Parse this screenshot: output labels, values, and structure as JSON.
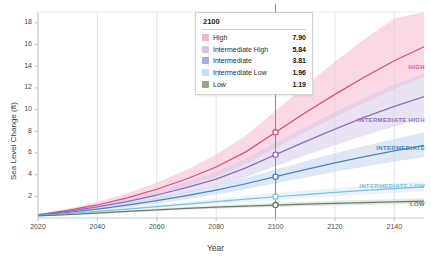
{
  "chart_data": {
    "type": "line",
    "title": "",
    "xlabel": "Year",
    "ylabel": "Sea Level Change (ft)",
    "xlim": [
      2020,
      2150
    ],
    "ylim": [
      0,
      19
    ],
    "xticks": [
      2020,
      2040,
      2060,
      2080,
      2100,
      2120,
      2140
    ],
    "yticks": [
      2,
      4,
      6,
      8,
      10,
      12,
      14,
      16,
      18
    ],
    "grid": "vertical-only",
    "legend_position": "inside-top-center",
    "hover_year": 2100,
    "x": [
      2020,
      2030,
      2040,
      2050,
      2060,
      2070,
      2080,
      2090,
      2100,
      2110,
      2120,
      2130,
      2140,
      2150
    ],
    "series": [
      {
        "name": "High",
        "label": "HIGH",
        "color": "#d4507f",
        "band_color": "#f7b8d0",
        "value_2100": "7.90",
        "values": [
          0.3,
          0.7,
          1.2,
          1.85,
          2.65,
          3.6,
          4.7,
          6.1,
          7.9,
          9.7,
          11.4,
          13.0,
          14.5,
          15.8
        ],
        "band_low": [
          0.25,
          0.58,
          0.98,
          1.5,
          2.15,
          2.9,
          3.8,
          4.95,
          6.45,
          7.9,
          9.3,
          10.6,
          11.9,
          13.0
        ],
        "band_high": [
          0.36,
          0.85,
          1.48,
          2.28,
          3.25,
          4.45,
          5.85,
          7.6,
          9.9,
          12.2,
          14.4,
          16.5,
          18.4,
          19.0
        ]
      },
      {
        "name": "Intermediate High",
        "label": "INTERMEDIATE HIGH",
        "color": "#8b6fb5",
        "band_color": "#d7cae8",
        "value_2100": "5.84",
        "values": [
          0.28,
          0.62,
          1.02,
          1.52,
          2.12,
          2.8,
          3.58,
          4.62,
          5.84,
          7.05,
          8.2,
          9.3,
          10.3,
          11.2
        ],
        "band_low": [
          0.23,
          0.52,
          0.85,
          1.26,
          1.74,
          2.3,
          2.94,
          3.78,
          4.78,
          5.78,
          6.72,
          7.62,
          8.44,
          9.18
        ],
        "band_high": [
          0.33,
          0.73,
          1.21,
          1.8,
          2.52,
          3.34,
          4.26,
          5.5,
          6.96,
          8.4,
          9.78,
          11.08,
          12.28,
          13.35
        ]
      },
      {
        "name": "Intermediate",
        "label": "INTERMEDIATE",
        "color": "#4f7fc0",
        "band_color": "#c3d4ec",
        "value_2100": "3.81",
        "values": [
          0.25,
          0.52,
          0.82,
          1.18,
          1.6,
          2.06,
          2.58,
          3.16,
          3.81,
          4.46,
          5.08,
          5.66,
          6.2,
          6.7
        ],
        "band_low": [
          0.21,
          0.44,
          0.69,
          0.99,
          1.34,
          1.73,
          2.16,
          2.65,
          3.2,
          3.74,
          4.26,
          4.75,
          5.2,
          5.62
        ],
        "band_high": [
          0.3,
          0.61,
          0.96,
          1.38,
          1.88,
          2.42,
          3.03,
          3.71,
          4.48,
          5.24,
          5.97,
          6.65,
          7.29,
          7.88
        ]
      },
      {
        "name": "Intermediate Low",
        "label": "INTERMEDIATE LOW",
        "color": "#7fbfe0",
        "band_color": "#d5eaf5",
        "value_2100": "1.96",
        "values": [
          0.22,
          0.4,
          0.6,
          0.82,
          1.05,
          1.28,
          1.52,
          1.74,
          1.96,
          2.16,
          2.36,
          2.54,
          2.72,
          2.88
        ],
        "band_low": [
          0.19,
          0.34,
          0.51,
          0.69,
          0.89,
          1.09,
          1.29,
          1.48,
          1.67,
          1.84,
          2.01,
          2.16,
          2.31,
          2.45
        ],
        "band_high": [
          0.26,
          0.47,
          0.7,
          0.96,
          1.23,
          1.5,
          1.78,
          2.04,
          2.3,
          2.53,
          2.77,
          2.98,
          3.19,
          3.38
        ]
      },
      {
        "name": "Low",
        "label": "LOW",
        "color": "#6e7a6b",
        "band_color": "#cdd7c9",
        "value_2100": "1.19",
        "values": [
          0.2,
          0.32,
          0.46,
          0.6,
          0.74,
          0.88,
          1.01,
          1.1,
          1.19,
          1.27,
          1.35,
          1.42,
          1.49,
          1.55
        ],
        "band_low": [
          0.17,
          0.27,
          0.39,
          0.51,
          0.63,
          0.75,
          0.86,
          0.94,
          1.01,
          1.08,
          1.15,
          1.21,
          1.27,
          1.32
        ],
        "band_high": [
          0.24,
          0.38,
          0.54,
          0.7,
          0.87,
          1.03,
          1.18,
          1.29,
          1.4,
          1.49,
          1.58,
          1.67,
          1.75,
          1.82
        ]
      }
    ]
  },
  "legend": {
    "title": "2100",
    "rows": [
      {
        "label": "High",
        "value": "7.90",
        "swatch": "#f3b6c8"
      },
      {
        "label": "Intermediate High",
        "value": "5.84",
        "swatch": "#d6c3e6"
      },
      {
        "label": "Intermediate",
        "value": "3.81",
        "swatch": "#9db2e0"
      },
      {
        "label": "Intermediate Low",
        "value": "1.96",
        "swatch": "#c3e0f0"
      },
      {
        "label": "Low",
        "value": "1.19",
        "swatch": "#93a38d"
      }
    ]
  },
  "axes": {
    "ylabel": "Sea Level Change (ft)",
    "xlabel": "Year",
    "yticks": [
      "18",
      "16",
      "14",
      "12",
      "10",
      "8",
      "6",
      "4",
      "2"
    ],
    "xticks": [
      "2020",
      "2040",
      "2060",
      "2080",
      "2100",
      "2120",
      "2140"
    ]
  }
}
